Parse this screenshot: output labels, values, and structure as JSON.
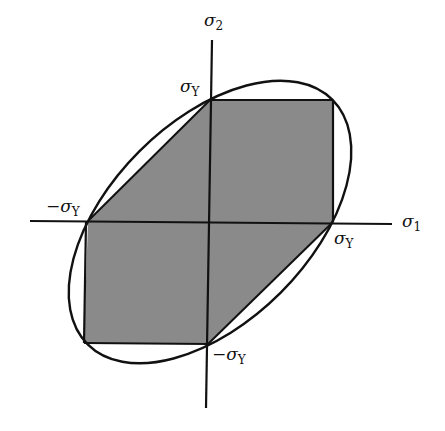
{
  "diagram": {
    "type": "yield-surface",
    "colors": {
      "fill": "#8a8a8a",
      "stroke": "#111111",
      "background": "#ffffff"
    },
    "axes": {
      "x_label": {
        "symbol": "σ",
        "subscript": "1"
      },
      "y_label": {
        "symbol": "σ",
        "subscript": "2"
      }
    },
    "labels": {
      "top": {
        "prefix": "",
        "symbol": "σ",
        "subscript": "Y"
      },
      "right": {
        "prefix": "",
        "symbol": "σ",
        "subscript": "Y"
      },
      "left": {
        "prefix": "−",
        "symbol": "σ",
        "subscript": "Y"
      },
      "bottom": {
        "prefix": "−",
        "symbol": "σ",
        "subscript": "Y"
      }
    }
  }
}
